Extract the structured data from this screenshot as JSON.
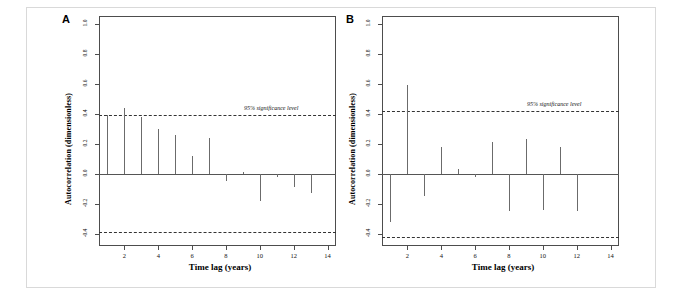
{
  "figure": {
    "panels": [
      {
        "label": "A",
        "ylabel": "Autocorrelation (dimensionless)",
        "xlabel": "Time lag (years)",
        "annotation": "95% significance level"
      },
      {
        "label": "B",
        "ylabel": "Autocorrelation (dimensionless)",
        "xlabel": "Time lag (years)",
        "annotation": "95% significance level"
      }
    ],
    "yticks": [
      "1.0",
      "0.8",
      "0.6",
      "0.4",
      "0.2",
      "0.0",
      "-0.2",
      "-0.4"
    ],
    "xticks": [
      "2",
      "4",
      "6",
      "8",
      "10",
      "12",
      "14"
    ],
    "colors": {
      "bar": "#6b6b6b",
      "axis": "#4d4d4d",
      "significance": "#333333",
      "frame": "#d9d9d9"
    }
  },
  "chart_data": [
    {
      "type": "bar",
      "title": "A",
      "xlabel": "Time lag (years)",
      "ylabel": "Autocorrelation (dimensionless)",
      "categories": [
        1,
        2,
        3,
        4,
        5,
        6,
        7,
        8,
        9,
        10,
        11,
        12,
        13
      ],
      "values": [
        0.39,
        0.44,
        0.38,
        0.3,
        0.26,
        0.12,
        0.24,
        -0.05,
        0.01,
        -0.18,
        -0.02,
        -0.09,
        -0.13
      ],
      "xlim": [
        0.5,
        14.5
      ],
      "ylim": [
        -0.48,
        1.05
      ],
      "yticks": [
        1.0,
        0.8,
        0.6,
        0.4,
        0.2,
        0.0,
        -0.2,
        -0.4
      ],
      "xticks": [
        2,
        4,
        6,
        8,
        10,
        12,
        14
      ],
      "grid": false,
      "legend": "none",
      "annotations": [
        {
          "text": "95% significance level",
          "value": 0.39,
          "style": "italic"
        }
      ],
      "significance_levels": [
        0.39,
        -0.39
      ]
    },
    {
      "type": "bar",
      "title": "B",
      "xlabel": "Time lag (years)",
      "ylabel": "Autocorrelation (dimensionless)",
      "categories": [
        1,
        2,
        3,
        4,
        5,
        6,
        7,
        8,
        9,
        10,
        11,
        12
      ],
      "values": [
        -0.32,
        0.59,
        -0.15,
        0.18,
        0.03,
        -0.02,
        0.21,
        -0.25,
        0.23,
        -0.24,
        0.18,
        -0.25
      ],
      "xlim": [
        0.5,
        14.5
      ],
      "ylim": [
        -0.48,
        1.05
      ],
      "yticks": [
        1.0,
        0.8,
        0.6,
        0.4,
        0.2,
        0.0,
        -0.2,
        -0.4
      ],
      "xticks": [
        2,
        4,
        6,
        8,
        10,
        12,
        14
      ],
      "grid": false,
      "legend": "none",
      "annotations": [
        {
          "text": "95% significance level",
          "value": 0.42,
          "style": "italic"
        }
      ],
      "significance_levels": [
        0.42,
        -0.42
      ]
    }
  ]
}
